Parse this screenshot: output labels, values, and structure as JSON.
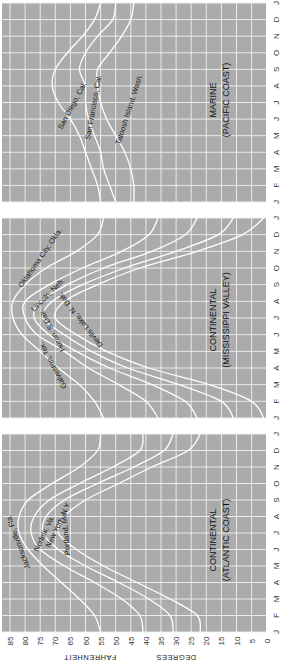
{
  "chart_data": {
    "type": "line",
    "orientation": "rotated 90 degrees clockwise (months run bottom-to-top, temperature left-to-right decreasing)",
    "ylabel": "DEGREES FAHRENHEIT",
    "temperature_ticks": [
      85,
      80,
      75,
      70,
      65,
      60,
      55,
      50,
      45,
      40,
      35,
      30,
      25,
      20,
      15,
      10,
      5,
      0
    ],
    "temperature_range": [
      0,
      85
    ],
    "month_labels": [
      "J",
      "F",
      "M",
      "A",
      "M",
      "J",
      "J",
      "A",
      "S",
      "O",
      "N",
      "D",
      "J"
    ],
    "grid": true,
    "panels": [
      {
        "id": "marine",
        "title_line1": "MARINE",
        "title_line2": "(PACIFIC COAST)",
        "series": [
          {
            "name": "San Diego, Cal.",
            "values": [
              55,
              56,
              58,
              60,
              62,
              65,
              69,
              71,
              70,
              66,
              61,
              57,
              55
            ]
          },
          {
            "name": "San Francisco, Cal.",
            "values": [
              50,
              52,
              54,
              55,
              57,
              59,
              60,
              60,
              62,
              60,
              56,
              51,
              50
            ]
          },
          {
            "name": "Tatoosh Island, Wash.",
            "values": [
              44,
              44,
              45,
              47,
              50,
              53,
              55,
              56,
              56,
              52,
              48,
              45,
              44
            ]
          }
        ]
      },
      {
        "id": "mississippi",
        "title_line1": "CONTINENTAL",
        "title_line2": "(MISSISSIPPI VALLEY)",
        "series": [
          {
            "name": "Galveston, Tex.",
            "values": [
              54,
              57,
              62,
              69,
              75,
              81,
              84,
              84,
              80,
              73,
              63,
              56,
              54
            ]
          },
          {
            "name": "Oklahoma City, Okla.",
            "values": [
              36,
              40,
              49,
              59,
              67,
              76,
              80,
              80,
              72,
              61,
              48,
              39,
              36
            ]
          },
          {
            "name": "Lincoln, Neb.",
            "values": [
              23,
              27,
              38,
              52,
              63,
              72,
              77,
              75,
              66,
              54,
              38,
              27,
              23
            ]
          },
          {
            "name": "Huron, S. Dak.",
            "values": [
              11,
              15,
              29,
              46,
              58,
              67,
              74,
              71,
              61,
              47,
              30,
              16,
              11
            ]
          },
          {
            "name": "Devils Lake, N. Dak.",
            "values": [
              1,
              5,
              19,
              39,
              53,
              63,
              70,
              67,
              56,
              42,
              23,
              8,
              1
            ]
          }
        ]
      },
      {
        "id": "atlantic",
        "title_line1": "CONTINENTAL",
        "title_line2": "(ATLANTIC COAST)",
        "series": [
          {
            "name": "Jacksonville, Fla.",
            "values": [
              55,
              57,
              62,
              68,
              74,
              79,
              82,
              82,
              79,
              71,
              62,
              56,
              55
            ]
          },
          {
            "name": "Norfolk, Va.",
            "values": [
              41,
              42,
              48,
              57,
              67,
              75,
              78,
              77,
              72,
              62,
              51,
              42,
              41
            ]
          },
          {
            "name": "New York, N.Y.",
            "values": [
              31,
              32,
              39,
              49,
              60,
              69,
              74,
              73,
              67,
              56,
              44,
              34,
              31
            ]
          },
          {
            "name": "Portland, Me.",
            "values": [
              22,
              23,
              32,
              43,
              54,
              63,
              69,
              67,
              60,
              49,
              38,
              26,
              22
            ]
          }
        ]
      }
    ]
  },
  "labels": {
    "axis_title_left": "DEGREES",
    "axis_title_right": "FAHRENHEIT",
    "marine_t1": "MARINE",
    "marine_t2": "(PACIFIC COAST)",
    "miss_t1": "CONTINENTAL",
    "miss_t2": "(MISSISSIPPI VALLEY)",
    "atl_t1": "CONTINENTAL",
    "atl_t2": "(ATLANTIC COAST)",
    "san_diego": "San Diego, Cal.",
    "san_francisco": "San Francisco, Cal.",
    "tatoosh": "Tatoosh Island, Wash.",
    "galveston": "Galveston, Tex.",
    "oklahoma": "Oklahoma City, Okla.",
    "lincoln": "Lincoln, Neb.",
    "huron": "Huron, S.Dak.",
    "devils_lake": "Devils Lake, N. Dak.",
    "jacksonville": "Jacksonville, Fla.",
    "norfolk": "Norfolk, Va.",
    "new_york": "New York, N.Y.",
    "portland": "Portland, Me."
  }
}
